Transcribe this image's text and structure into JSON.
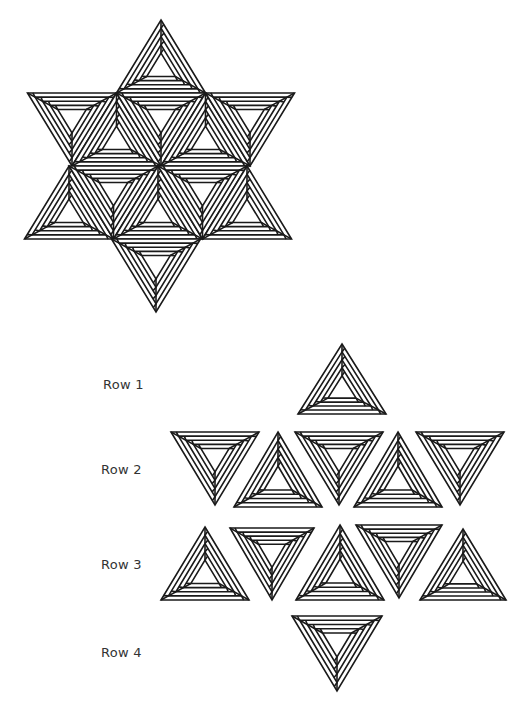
{
  "figure": {
    "title": "",
    "background": "#ffffff",
    "line_color": "#1a1a1a",
    "assembled_star": {
      "description": "Six-pointed star assembled from 12 nested-band triangles",
      "center": [
        163,
        163
      ],
      "top_apex": [
        163,
        20
      ],
      "bottom_apex": [
        156,
        314
      ],
      "left_upper": [
        28,
        93
      ],
      "right_upper": [
        296,
        93
      ],
      "left_lower": [
        24,
        239
      ],
      "right_lower": [
        290,
        239
      ]
    },
    "rows": [
      {
        "label": "Row 1",
        "label_pos": [
          103,
          385
        ],
        "triangles": [
          {
            "dir": "up",
            "cx": 342,
            "top": 344,
            "bottom": 414,
            "half": 44
          }
        ]
      },
      {
        "label": "Row 2",
        "label_pos": [
          101,
          470
        ],
        "triangles": [
          {
            "dir": "down",
            "cx": 215,
            "top": 432,
            "bottom": 505,
            "half": 44
          },
          {
            "dir": "up",
            "cx": 278,
            "top": 432,
            "bottom": 507,
            "half": 44
          },
          {
            "dir": "down",
            "cx": 339,
            "top": 432,
            "bottom": 505,
            "half": 44
          },
          {
            "dir": "up",
            "cx": 398,
            "top": 432,
            "bottom": 507,
            "half": 44
          },
          {
            "dir": "down",
            "cx": 460,
            "top": 432,
            "bottom": 505,
            "half": 44
          }
        ]
      },
      {
        "label": "Row 3",
        "label_pos": [
          101,
          565
        ],
        "triangles": [
          {
            "dir": "up",
            "cx": 205,
            "top": 527,
            "bottom": 600,
            "half": 44
          },
          {
            "dir": "down",
            "cx": 272,
            "top": 528,
            "bottom": 600,
            "half": 42
          },
          {
            "dir": "up",
            "cx": 340,
            "top": 525,
            "bottom": 600,
            "half": 44
          },
          {
            "dir": "down",
            "cx": 399,
            "top": 525,
            "bottom": 598,
            "half": 43
          },
          {
            "dir": "up",
            "cx": 463,
            "top": 529,
            "bottom": 600,
            "half": 43
          }
        ]
      },
      {
        "label": "Row 4",
        "label_pos": [
          101,
          653
        ],
        "triangles": [
          {
            "dir": "down",
            "cx": 337,
            "top": 616,
            "bottom": 691,
            "half": 45
          }
        ]
      }
    ]
  }
}
